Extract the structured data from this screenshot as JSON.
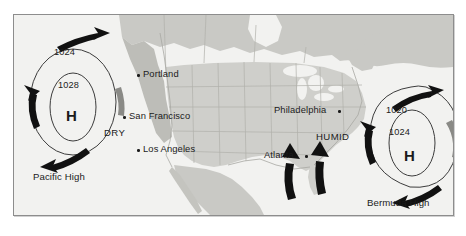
{
  "figure": {
    "kind": "weather-map",
    "frame": {
      "x": 13,
      "y": 14,
      "width": 439,
      "height": 200
    }
  },
  "colors": {
    "page_background": "#ffffff",
    "map_background": "#f2f2f0",
    "ocean": "#f2f2f0",
    "land": "#c9c9c5",
    "land_light": "#d6d6d2",
    "state_border": "#b0b0ab",
    "frame_border": "#8d8d8d",
    "isobar": "#3c3c3c",
    "arrow": "#111111",
    "text": "#1b1b1b"
  },
  "pressure_systems": [
    {
      "id": "pacific-high",
      "name": "Pacific High",
      "center_symbol": "H",
      "isobars": [
        {
          "value": "1024",
          "ring": "outer"
        },
        {
          "value": "1028",
          "ring": "inner"
        }
      ],
      "circulation": "clockwise",
      "name_label_pos": {
        "x": 32,
        "y": 170
      },
      "center": {
        "x": 72,
        "y": 101
      }
    },
    {
      "id": "bermuda-high",
      "name": "Bermuda High",
      "center_symbol": "H",
      "isobars": [
        {
          "value": "1020",
          "ring": "outer"
        },
        {
          "value": "1024",
          "ring": "inner"
        }
      ],
      "circulation": "clockwise",
      "name_label_pos": {
        "x": 366,
        "y": 196
      },
      "center": {
        "x": 410,
        "y": 140
      }
    }
  ],
  "air_masses": [
    {
      "label": "DRY",
      "x": 103,
      "y": 126,
      "system": "pacific-high"
    },
    {
      "label": "HUMID",
      "x": 315,
      "y": 130,
      "system": "bermuda-high"
    }
  ],
  "cities": [
    {
      "name": "Portland",
      "dot_side": "left",
      "dot": {
        "x": 136,
        "y": 72
      },
      "label": {
        "x": 142,
        "y": 67
      }
    },
    {
      "name": "San Francisco",
      "dot_side": "left",
      "dot": {
        "x": 122,
        "y": 114
      },
      "label": {
        "x": 128,
        "y": 109
      }
    },
    {
      "name": "Los Angeles",
      "dot_side": "left",
      "dot": {
        "x": 136,
        "y": 147
      },
      "label": {
        "x": 142,
        "y": 142
      }
    },
    {
      "name": "Philadelphia",
      "dot_side": "right",
      "dot": {
        "x": 337,
        "y": 108
      },
      "label": {
        "x": 273,
        "y": 103
      }
    },
    {
      "name": "Atlanta",
      "dot_side": "right",
      "dot": {
        "x": 304,
        "y": 153
      },
      "label": {
        "x": 263,
        "y": 148
      }
    }
  ]
}
